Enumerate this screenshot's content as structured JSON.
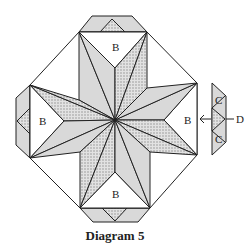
{
  "diagram": {
    "caption": "Diagram 5",
    "labels": {
      "b_top": "B",
      "b_left": "B",
      "b_right": "B",
      "b_bottom": "B",
      "c_upper": "C",
      "c_lower": "C",
      "d": "D"
    },
    "colors": {
      "stroke": "#222222",
      "light_fill": "#d9d9d9",
      "dotted_fill": "#c8c8c8",
      "white_fill": "#ffffff"
    }
  }
}
